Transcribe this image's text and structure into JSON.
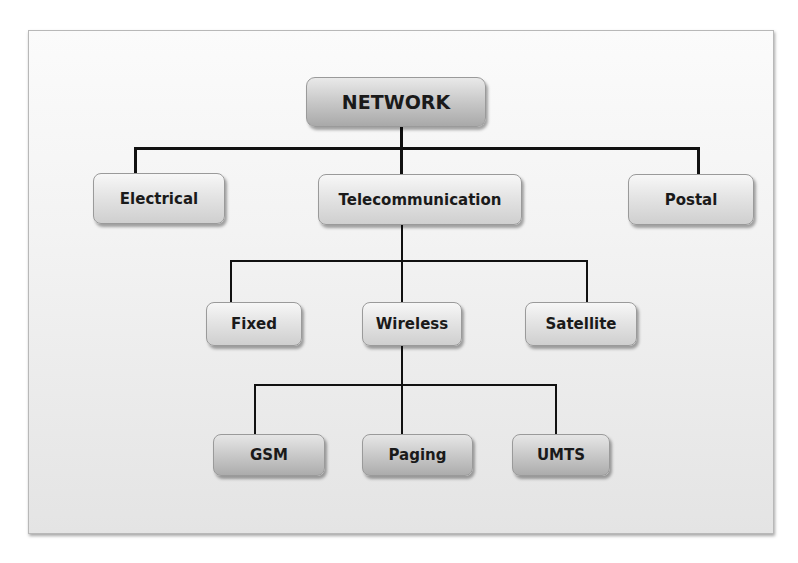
{
  "diagram": {
    "type": "hierarchy",
    "root": {
      "label": "NETWORK",
      "children": [
        {
          "label": "Electrical"
        },
        {
          "label": "Telecommunication",
          "children": [
            {
              "label": "Fixed"
            },
            {
              "label": "Wireless",
              "children": [
                {
                  "label": "GSM"
                },
                {
                  "label": "Paging"
                },
                {
                  "label": "UMTS"
                }
              ]
            },
            {
              "label": "Satellite"
            }
          ]
        },
        {
          "label": "Postal"
        }
      ]
    }
  },
  "colors": {
    "line": "#111111",
    "node_border": "#9a9a9a",
    "text": "#1a1a1a",
    "frame_border": "#b8b8b8"
  }
}
